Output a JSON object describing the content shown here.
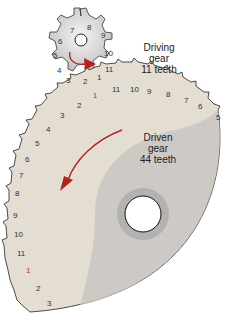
{
  "diagram": {
    "driving_gear": {
      "label_line1": "Driving",
      "label_line2": "gear",
      "label_line3": "11 teeth",
      "teeth": 11,
      "tooth_numbers": [
        "1",
        "2",
        "3",
        "4",
        "5",
        "6",
        "7",
        "8",
        "9",
        "10",
        "11"
      ],
      "rotation": "clockwise"
    },
    "driven_gear": {
      "label_line1": "Driven",
      "label_line2": "gear",
      "label_line3": "44 teeth",
      "teeth": 44,
      "visible_tooth_numbers_top": [
        "11",
        "10",
        "9",
        "8",
        "7",
        "6",
        "5"
      ],
      "visible_tooth_numbers_left": [
        "1",
        "2",
        "3",
        "4",
        "5",
        "6",
        "7",
        "8",
        "9",
        "10",
        "11",
        "1",
        "2",
        "3"
      ],
      "rotation": "counterclockwise"
    },
    "colors": {
      "gear_fill": "#e3ddd2",
      "gear_shade": "#c9c7c4",
      "hub_ring": "#a9a9aa",
      "arrow": "#b22222",
      "outline": "#222222"
    }
  }
}
